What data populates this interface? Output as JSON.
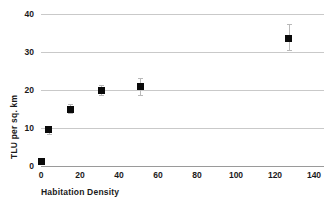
{
  "chart_data": {
    "type": "scatter",
    "title": "",
    "xlabel": "Habitation Density",
    "ylabel": "TLU per sq. km",
    "xlim": [
      0,
      140
    ],
    "ylim": [
      0,
      40
    ],
    "xticks": [
      "0",
      "20",
      "40",
      "60",
      "80",
      "100",
      "120",
      "140"
    ],
    "xtick_values": [
      0,
      20,
      40,
      60,
      80,
      100,
      120,
      140
    ],
    "yticks": [
      "0",
      "10",
      "20",
      "30",
      "40"
    ],
    "ytick_values": [
      0,
      10,
      20,
      30,
      40
    ],
    "grid": "horizontal",
    "legend": "none",
    "marker_style": "filled-square",
    "error_bars": "vertical",
    "points": [
      {
        "x": 0,
        "y": 1.3,
        "yerr_low": 0.5,
        "yerr_high": 0.5
      },
      {
        "x": 4,
        "y": 9.5,
        "yerr_low": 1.0,
        "yerr_high": 1.0
      },
      {
        "x": 15,
        "y": 15.0,
        "yerr_low": 1.0,
        "yerr_high": 1.3
      },
      {
        "x": 31,
        "y": 20.0,
        "yerr_low": 1.3,
        "yerr_high": 1.3
      },
      {
        "x": 51,
        "y": 21.0,
        "yerr_low": 2.2,
        "yerr_high": 2.2
      },
      {
        "x": 127,
        "y": 33.5,
        "yerr_low": 3.0,
        "yerr_high": 4.0
      }
    ],
    "colors": {
      "marker": "#0a0a0a",
      "gridline": "#c9c9c9",
      "axis": "#9a9a9a",
      "errorbar": "#b9b9b9",
      "text": "#1a1a1a",
      "background": "#ffffff"
    }
  }
}
